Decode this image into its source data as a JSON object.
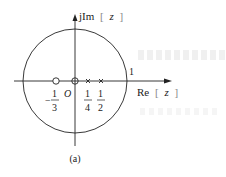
{
  "figure": {
    "type": "pole-zero plot",
    "caption": "(a)",
    "axes": {
      "imag_label_prefix": "jIm",
      "imag_label_bracket_open": "[",
      "imag_label_var": "z",
      "imag_label_bracket_close": "]",
      "real_label_prefix": "Re",
      "real_label_bracket_open": "[",
      "real_label_var": "z",
      "real_label_bracket_close": "]",
      "origin_label": "O"
    },
    "unit_circle": {
      "radius_label": "1"
    },
    "zeros": [
      {
        "position": "-1/3",
        "numerator": "1",
        "denominator": "3",
        "sign": "−"
      },
      {
        "position": "0"
      }
    ],
    "poles": [
      {
        "position": "1/4",
        "numerator": "1",
        "denominator": "4"
      },
      {
        "position": "1/2",
        "numerator": "1",
        "denominator": "2"
      }
    ],
    "colors": {
      "stroke": "#222222",
      "background": "#ffffff"
    }
  }
}
